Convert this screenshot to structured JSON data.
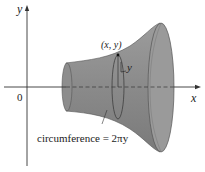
{
  "diagram": {
    "type": "solid-of-revolution",
    "axes": {
      "x_label": "x",
      "y_label": "y",
      "origin_label": "0"
    },
    "point_label": "(x, y)",
    "radius_label": "y",
    "circumference_label": "circumference = 2πy",
    "colors": {
      "solid_fill": "#8f8f8f",
      "solid_dark": "#6e6e6e",
      "end_cap": "#9a9a9a",
      "axis": "#333333"
    }
  }
}
